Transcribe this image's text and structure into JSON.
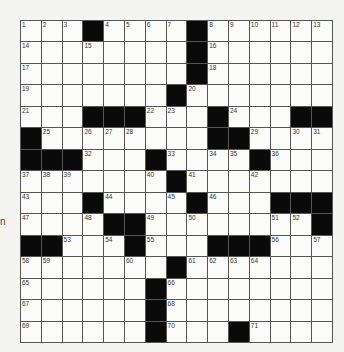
{
  "puzzle": {
    "rows": 15,
    "cols": 15,
    "grid": [
      [
        "1",
        "2",
        "3",
        "#",
        "4",
        "5",
        "6",
        "7",
        "#",
        "8",
        "9",
        "10",
        "11",
        "12",
        "13"
      ],
      [
        "14",
        "",
        "",
        "15",
        "",
        "",
        "",
        "",
        "#",
        "16",
        "",
        "",
        "",
        "",
        ""
      ],
      [
        "17",
        "",
        "",
        "",
        "",
        "",
        "",
        "",
        "#",
        "18",
        "",
        "",
        "",
        "",
        ""
      ],
      [
        "19",
        "",
        "",
        "",
        "",
        "",
        "",
        "#",
        "20",
        "",
        "",
        "",
        "",
        "",
        ""
      ],
      [
        "21",
        "",
        "",
        "#",
        "#",
        "#",
        "22",
        "23",
        "",
        "#",
        "24",
        "",
        "",
        "#",
        "#"
      ],
      [
        "#",
        "25",
        "",
        "26",
        "27",
        "28",
        "",
        "",
        "",
        "#",
        "#",
        "29",
        "",
        "30",
        "31"
      ],
      [
        "#",
        "#",
        "#",
        "32",
        "",
        "",
        "#",
        "33",
        "",
        "34",
        "35",
        "#",
        "36",
        "",
        ""
      ],
      [
        "37",
        "38",
        "39",
        "",
        "",
        "",
        "40",
        "#",
        "41",
        "",
        "",
        "42",
        "",
        "",
        ""
      ],
      [
        "43",
        "",
        "",
        "#",
        "44",
        "",
        "",
        "45",
        "#",
        "46",
        "",
        "",
        "#",
        "#",
        "#"
      ],
      [
        "47",
        "",
        "",
        "48",
        "#",
        "#",
        "49",
        "",
        "50",
        "",
        "",
        "",
        "51",
        "52",
        "#"
      ],
      [
        "#",
        "#",
        "53",
        "",
        "54",
        "#",
        "55",
        "",
        "",
        "#",
        "#",
        "#",
        "56",
        "",
        "57"
      ],
      [
        "58",
        "59",
        "",
        "",
        "",
        "60",
        "",
        "#",
        "61",
        "62",
        "63",
        "64",
        "",
        "",
        ""
      ],
      [
        "65",
        "",
        "",
        "",
        "",
        "",
        "#",
        "66",
        "",
        "",
        "",
        "",
        "",
        "",
        ""
      ],
      [
        "67",
        "",
        "",
        "",
        "",
        "",
        "#",
        "68",
        "",
        "",
        "",
        "",
        "",
        "",
        ""
      ],
      [
        "69",
        "",
        "",
        "",
        "",
        "",
        "#",
        "70",
        "",
        "",
        "#",
        "71",
        "",
        "",
        ""
      ]
    ],
    "colors": {
      "black_cell": "#0a0a0a",
      "white_cell": "#fbfbf9",
      "grid_line": "#555555",
      "page_bg": "#f4f4f2"
    }
  },
  "margin": {
    "fragment_1": "n",
    "fragment_2": ""
  }
}
